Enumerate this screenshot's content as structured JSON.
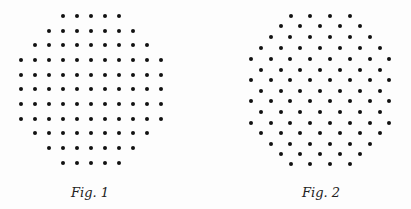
{
  "figures": [
    {
      "id": "fig1",
      "caption": "Fig. 1",
      "caption_center_x": 90,
      "pattern": "square-lattice",
      "dot_color": "#111111",
      "dot_diameter": 4,
      "columns_x": [
        21,
        35,
        49,
        63,
        77,
        91,
        105,
        119,
        133,
        147,
        161
      ],
      "rows": [
        {
          "y": 16,
          "first_col": 3,
          "count": 5
        },
        {
          "y": 31,
          "first_col": 2,
          "count": 7
        },
        {
          "y": 45,
          "first_col": 1,
          "count": 9
        },
        {
          "y": 60,
          "first_col": 0,
          "count": 11
        },
        {
          "y": 75,
          "first_col": 0,
          "count": 11
        },
        {
          "y": 89,
          "first_col": 0,
          "count": 11
        },
        {
          "y": 104,
          "first_col": 0,
          "count": 11
        },
        {
          "y": 119,
          "first_col": 0,
          "count": 11
        },
        {
          "y": 133,
          "first_col": 1,
          "count": 9
        },
        {
          "y": 148,
          "first_col": 2,
          "count": 7
        },
        {
          "y": 163,
          "first_col": 3,
          "count": 5
        }
      ],
      "total_dots": 97
    },
    {
      "id": "fig2",
      "caption": "Fig. 2",
      "caption_center_x": 321,
      "pattern": "hexagonal-lattice",
      "dot_color": "#111111",
      "dot_diameter": 4,
      "spacing_x": 19.8,
      "rows": [
        {
          "y": 16,
          "start_x": 290.5,
          "count": 4
        },
        {
          "y": 26,
          "start_x": 280.5,
          "count": 5
        },
        {
          "y": 37,
          "start_x": 270.6,
          "count": 6
        },
        {
          "y": 48,
          "start_x": 260.7,
          "count": 7
        },
        {
          "y": 59,
          "start_x": 250.8,
          "count": 8
        },
        {
          "y": 70,
          "start_x": 260.7,
          "count": 7
        },
        {
          "y": 80,
          "start_x": 250.8,
          "count": 8
        },
        {
          "y": 91,
          "start_x": 260.7,
          "count": 7
        },
        {
          "y": 101,
          "start_x": 250.8,
          "count": 8
        },
        {
          "y": 112,
          "start_x": 260.7,
          "count": 7
        },
        {
          "y": 123,
          "start_x": 250.8,
          "count": 8
        },
        {
          "y": 133,
          "start_x": 260.7,
          "count": 7
        },
        {
          "y": 144,
          "start_x": 270.6,
          "count": 6
        },
        {
          "y": 154,
          "start_x": 280.5,
          "count": 5
        },
        {
          "y": 164,
          "start_x": 290.5,
          "count": 4
        }
      ],
      "total_dots": 97
    }
  ]
}
